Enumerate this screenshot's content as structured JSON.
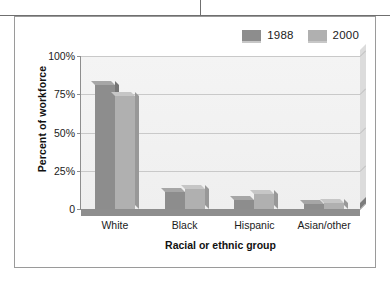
{
  "chart_data": {
    "type": "bar",
    "title": "",
    "subtitle": "",
    "xlabel": "Racial or ethnic group",
    "ylabel": "Percent of workforce",
    "categories": [
      "White",
      "Black",
      "Hispanic",
      "Asian/other"
    ],
    "series": [
      {
        "name": "1988",
        "color": "#8d8d8d",
        "values": [
          81,
          11,
          6,
          3
        ]
      },
      {
        "name": "2000",
        "color": "#b0b0b0",
        "values": [
          74,
          13,
          10,
          4
        ]
      }
    ],
    "ylim": [
      0,
      100
    ],
    "yticks": [
      0,
      25,
      50,
      75,
      100
    ],
    "ytick_labels": [
      "0",
      "25%",
      "50%",
      "75%",
      "100%"
    ],
    "grid": true,
    "legend_position": "top-right",
    "style": "3d-bar",
    "plot_background": "#f2f2f2",
    "gridline_color": "#c9c9c9",
    "frame_color": "#9a9a9a"
  },
  "legend": {
    "entries": [
      {
        "label": "1988",
        "color": "#8d8d8d"
      },
      {
        "label": "2000",
        "color": "#b0b0b0"
      }
    ]
  },
  "axes": {
    "y_title": "Percent of workforce",
    "x_title": "Racial or ethnic group",
    "y_labels": [
      "100%",
      "75%",
      "50%",
      "25%",
      "0"
    ],
    "x_labels": [
      "White",
      "Black",
      "Hispanic",
      "Asian/other"
    ]
  }
}
